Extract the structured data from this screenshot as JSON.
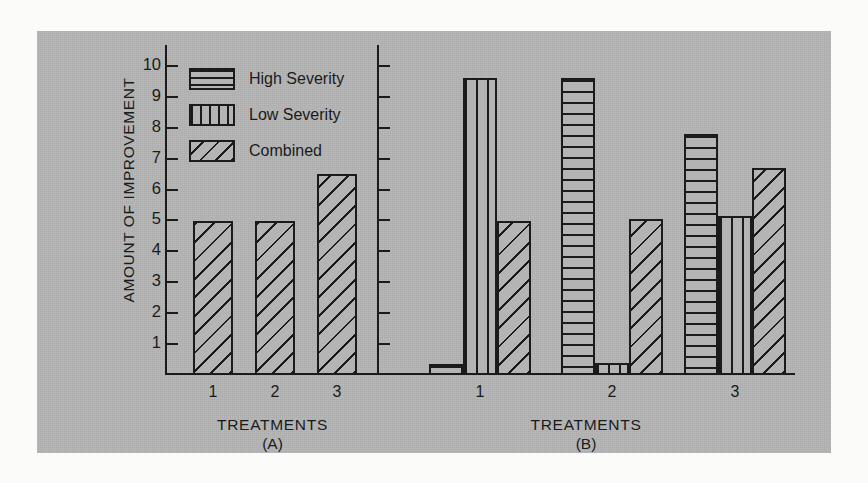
{
  "figure": {
    "ylabel": "AMOUNT OF IMPROVEMENT",
    "legend": [
      {
        "label": "High Severity",
        "pattern": "horizontal-lines"
      },
      {
        "label": "Low Severity",
        "pattern": "vertical-lines"
      },
      {
        "label": "Combined",
        "pattern": "diagonal-lines"
      }
    ],
    "panels": [
      {
        "id": "A",
        "xlabel": "TREATMENTS",
        "letter": "(A)"
      },
      {
        "id": "B",
        "xlabel": "TREATMENTS",
        "letter": "(B)"
      }
    ],
    "y_ticks": [
      "10",
      "9",
      "8",
      "7",
      "6",
      "5",
      "4",
      "3",
      "2",
      "1"
    ],
    "x_ticks": [
      "1",
      "2",
      "3"
    ],
    "colors": {
      "panel_background": "#b4b4b4",
      "ink": "#1b1b1b",
      "page": "#fbfbfa"
    }
  },
  "chart_data": [
    {
      "type": "bar",
      "title": "(A)",
      "xlabel": "TREATMENTS",
      "ylabel": "AMOUNT OF IMPROVEMENT",
      "categories": [
        "1",
        "2",
        "3"
      ],
      "series": [
        {
          "name": "Combined",
          "values": [
            5.0,
            5.0,
            6.5
          ]
        }
      ],
      "ylim": [
        0,
        10.3
      ],
      "yticks": [
        1,
        2,
        3,
        4,
        5,
        6,
        7,
        8,
        9,
        10
      ],
      "grid": false,
      "legend_position": "top-left-shared"
    },
    {
      "type": "bar",
      "title": "(B)",
      "xlabel": "TREATMENTS",
      "ylabel": "AMOUNT OF IMPROVEMENT",
      "categories": [
        "1",
        "2",
        "3"
      ],
      "series": [
        {
          "name": "High Severity",
          "values": [
            0.35,
            9.6,
            7.8
          ]
        },
        {
          "name": "Low Severity",
          "values": [
            9.6,
            0.4,
            5.15
          ]
        },
        {
          "name": "Combined",
          "values": [
            5.0,
            5.05,
            6.7
          ]
        }
      ],
      "ylim": [
        0,
        10.3
      ],
      "yticks": [
        1,
        2,
        3,
        4,
        5,
        6,
        7,
        8,
        9,
        10
      ],
      "ytick_labels_shown": false,
      "grid": false,
      "legend_position": "top-left-shared"
    }
  ]
}
